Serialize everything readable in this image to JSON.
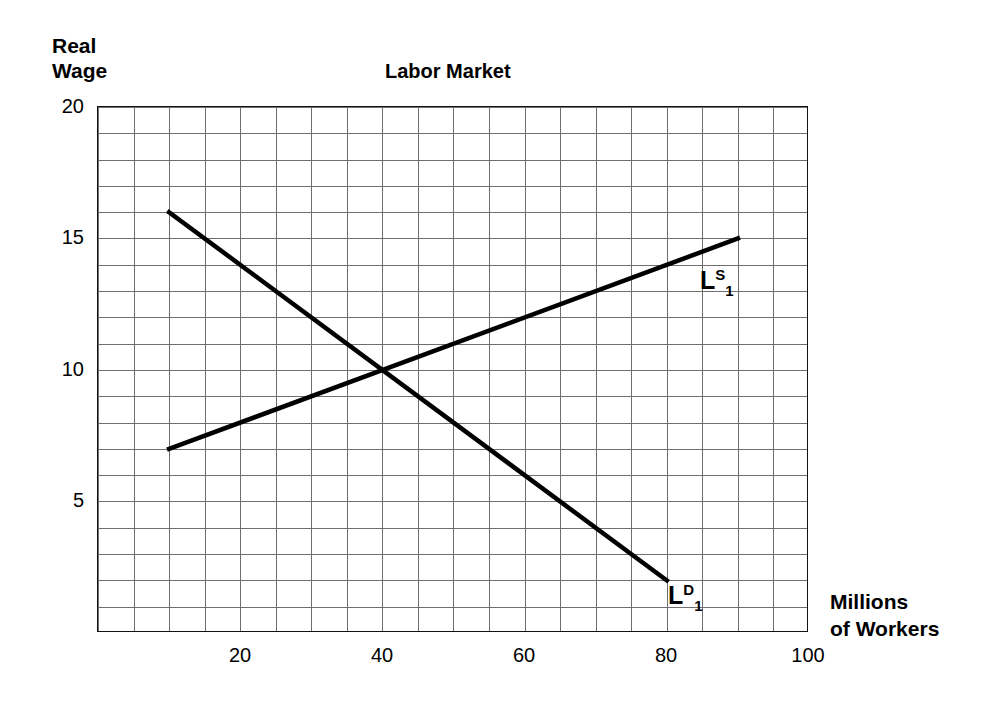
{
  "chart_data": {
    "type": "line",
    "title": "Labor Market",
    "ylabel_line1": "Real",
    "ylabel_line2": "Wage",
    "xlabel_line1": "Millions",
    "xlabel_line2": "of Workers",
    "xlim": [
      0,
      100
    ],
    "ylim": [
      0,
      20
    ],
    "xticks": [
      20,
      40,
      60,
      80,
      100
    ],
    "yticks": [
      5,
      10,
      15,
      20
    ],
    "grid": true,
    "grid_x_step": 5,
    "grid_y_step": 1,
    "grid_color": "#6e6e6e",
    "axis_color": "#111111",
    "curve_color": "#000000",
    "legend": "none",
    "equilibrium": {
      "x": 40,
      "y": 10
    },
    "series": [
      {
        "name": "Labor Supply",
        "label_base": "L",
        "label_sup": "S",
        "label_sub": "1",
        "points": [
          [
            10,
            7
          ],
          [
            90,
            15
          ]
        ],
        "label_x": 90,
        "label_y": 13
      },
      {
        "name": "Labor Demand",
        "label_base": "L",
        "label_sup": "D",
        "label_sub": "1",
        "points": [
          [
            10,
            16
          ],
          [
            80,
            2
          ]
        ],
        "label_x": 81,
        "label_y": 2
      }
    ]
  },
  "ytick_labels": [
    "20",
    "15",
    "10",
    "5"
  ],
  "xtick_labels": [
    "20",
    "40",
    "60",
    "80",
    "100"
  ]
}
